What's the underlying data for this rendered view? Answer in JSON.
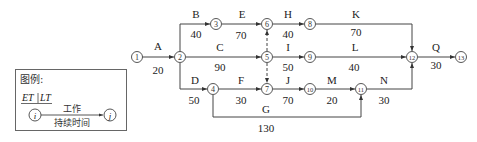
{
  "diagram": {
    "type": "double-code network diagram (双代号网络图)",
    "nodes": [
      {
        "id": "1",
        "label": "①",
        "x": 137,
        "y": 57
      },
      {
        "id": "2",
        "label": "②",
        "x": 180,
        "y": 57
      },
      {
        "id": "3",
        "label": "③",
        "x": 216,
        "y": 24
      },
      {
        "id": "4",
        "label": "④",
        "x": 213,
        "y": 89
      },
      {
        "id": "5",
        "label": "⑤",
        "x": 267,
        "y": 57
      },
      {
        "id": "6",
        "label": "⑥",
        "x": 267,
        "y": 24
      },
      {
        "id": "7",
        "label": "⑦",
        "x": 267,
        "y": 89
      },
      {
        "id": "8",
        "label": "⑧",
        "x": 310,
        "y": 24
      },
      {
        "id": "9",
        "label": "⑨",
        "x": 310,
        "y": 57
      },
      {
        "id": "10",
        "label": "⑩",
        "x": 310,
        "y": 89
      },
      {
        "id": "11",
        "label": "⑪",
        "x": 361,
        "y": 89
      },
      {
        "id": "12",
        "label": "⑫",
        "x": 412,
        "y": 57
      },
      {
        "id": "13",
        "label": "⑬",
        "x": 461,
        "y": 57
      }
    ],
    "activities": [
      {
        "name": "A",
        "from": "1",
        "to": "2",
        "duration": "20"
      },
      {
        "name": "B",
        "from": "2",
        "to": "3",
        "duration": "40"
      },
      {
        "name": "C",
        "from": "2",
        "to": "5",
        "duration": "90"
      },
      {
        "name": "D",
        "from": "2",
        "to": "4",
        "duration": "50"
      },
      {
        "name": "E",
        "from": "3",
        "to": "6",
        "duration": "70"
      },
      {
        "name": "F",
        "from": "4",
        "to": "7",
        "duration": "30"
      },
      {
        "name": "G",
        "from": "4",
        "to": "11",
        "duration": "130"
      },
      {
        "name": "H",
        "from": "6",
        "to": "8",
        "duration": "40"
      },
      {
        "name": "I",
        "from": "5",
        "to": "9",
        "duration": "50"
      },
      {
        "name": "J",
        "from": "7",
        "to": "10",
        "duration": "70"
      },
      {
        "name": "K",
        "from": "8",
        "to": "12",
        "duration": "70"
      },
      {
        "name": "L",
        "from": "9",
        "to": "12",
        "duration": "40"
      },
      {
        "name": "M",
        "from": "10",
        "to": "11",
        "duration": "20"
      },
      {
        "name": "N",
        "from": "11",
        "to": "12",
        "duration": "30"
      },
      {
        "name": "Q",
        "from": "12",
        "to": "13",
        "duration": "30"
      }
    ],
    "dummies": [
      {
        "from": "5",
        "to": "6"
      },
      {
        "from": "5",
        "to": "7"
      }
    ]
  },
  "legend": {
    "title": "图例:",
    "header": "ET | LT",
    "header_et": "ET",
    "header_lt": "LT",
    "node_i": "i",
    "node_j": "j",
    "work_label": "工作",
    "duration_label": "持续时间"
  }
}
